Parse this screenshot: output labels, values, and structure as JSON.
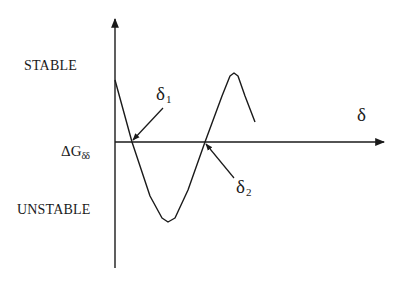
{
  "diagram": {
    "labels": {
      "stable": "STABLE",
      "unstable": "UNSTABLE",
      "x_axis": "δ",
      "y_axis_main": "ΔG",
      "y_axis_sub": "δδ",
      "delta1_main": "δ",
      "delta1_sub": "1",
      "delta2_main": "δ",
      "delta2_sub": "2"
    },
    "colors": {
      "stroke": "#1a1a1a",
      "background": "#ffffff"
    },
    "axes": {
      "origin": [
        115,
        142
      ],
      "y_axis_top": [
        115,
        17
      ],
      "y_axis_bottom": [
        115,
        268
      ],
      "x_axis_end": [
        385,
        142
      ]
    },
    "curve_points": [
      [
        115,
        80
      ],
      [
        132,
        142
      ],
      [
        150,
        196
      ],
      [
        162,
        218
      ],
      [
        168,
        222
      ],
      [
        175,
        218
      ],
      [
        188,
        190
      ],
      [
        205,
        142
      ],
      [
        222,
        96
      ],
      [
        230,
        76
      ],
      [
        234,
        73
      ],
      [
        238,
        76
      ],
      [
        245,
        96
      ],
      [
        255,
        122
      ]
    ],
    "annotations": [
      {
        "name": "delta1",
        "arrow_from": [
          163,
          108
        ],
        "arrow_to": [
          133,
          140
        ]
      },
      {
        "name": "delta2",
        "arrow_from": [
          234,
          178
        ],
        "arrow_to": [
          206,
          144
        ]
      }
    ]
  }
}
